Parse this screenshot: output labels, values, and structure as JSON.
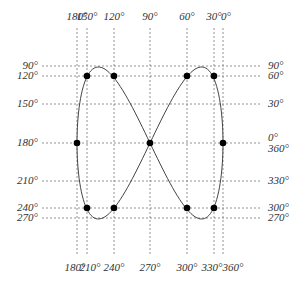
{
  "diagram": {
    "top_labels": [
      {
        "text": "180°",
        "x": 77
      },
      {
        "text": "150°",
        "x": 87
      },
      {
        "text": "120°",
        "x": 114
      },
      {
        "text": "90°",
        "x": 150
      },
      {
        "text": "60°",
        "x": 187
      },
      {
        "text": "30°",
        "x": 214
      },
      {
        "text": "0°",
        "x": 226
      }
    ],
    "bottom_labels": [
      {
        "text": "180°",
        "x": 75
      },
      {
        "text": "210°",
        "x": 90
      },
      {
        "text": "240°",
        "x": 114
      },
      {
        "text": "270°",
        "x": 150
      },
      {
        "text": "300°",
        "x": 187
      },
      {
        "text": "330°",
        "x": 212
      },
      {
        "text": "360°",
        "x": 233
      }
    ],
    "left_labels": [
      {
        "text": "90°",
        "y": 66
      },
      {
        "text": "120°",
        "y": 76
      },
      {
        "text": "150°",
        "y": 104
      },
      {
        "text": "180°",
        "y": 143
      },
      {
        "text": "210°",
        "y": 181
      },
      {
        "text": "240°",
        "y": 208
      },
      {
        "text": "270°",
        "y": 218
      }
    ],
    "right_labels": [
      {
        "text": "90°",
        "y": 66
      },
      {
        "text": "60°",
        "y": 76
      },
      {
        "text": "30°",
        "y": 104
      },
      {
        "text": "0°",
        "y": 138
      },
      {
        "text": "360°",
        "y": 149
      },
      {
        "text": "330°",
        "y": 181
      },
      {
        "text": "300°",
        "y": 208
      },
      {
        "text": "270°",
        "y": 218
      }
    ],
    "vertical_gridlines_x": [
      77,
      87,
      114,
      150,
      187,
      214,
      223
    ],
    "horizontal_gridlines_y": [
      66,
      76,
      104,
      143,
      181,
      208,
      218
    ],
    "dots": [
      [
        87,
        76
      ],
      [
        114,
        76
      ],
      [
        187,
        76
      ],
      [
        214,
        76
      ],
      [
        77,
        143
      ],
      [
        150,
        143
      ],
      [
        223,
        143
      ],
      [
        87,
        208
      ],
      [
        114,
        208
      ],
      [
        187,
        208
      ],
      [
        214,
        208
      ]
    ],
    "curve": {
      "cx": 150,
      "cy": 143,
      "ax": 73,
      "ay": 76
    }
  }
}
